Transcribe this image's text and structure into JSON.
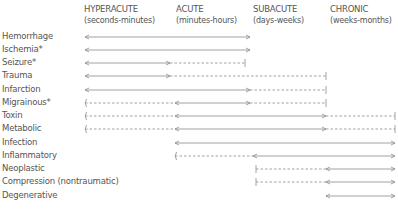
{
  "headers": [
    {
      "title": "HYPERACUTE",
      "sub": "(seconds-minutes)",
      "x": 84
    },
    {
      "title": "ACUTE",
      "sub": "(minutes-hours)",
      "x": 176
    },
    {
      "title": "SUBACUTE",
      "sub": "(days-weeks)",
      "x": 253
    },
    {
      "title": "CHRONIC",
      "sub": "(weeks-months)",
      "x": 330
    }
  ],
  "colors": {
    "text": "#555555",
    "line": "#8a8a8a"
  },
  "timeline_x": {
    "hyper": 85,
    "acute": 175,
    "subacute_start": 252,
    "subacute_end": 327,
    "chronic": 395
  },
  "rows": [
    {
      "label": "Hemorrhage",
      "segments": [
        {
          "from": 85,
          "to": 250,
          "style": "solid",
          "start": "arrow",
          "end": "arrow"
        }
      ]
    },
    {
      "label": "Ischemia*",
      "segments": [
        {
          "from": 85,
          "to": 250,
          "style": "solid",
          "start": "arrow",
          "end": "arrow"
        }
      ]
    },
    {
      "label": "Seizure*",
      "segments": [
        {
          "from": 85,
          "to": 170,
          "style": "solid",
          "start": "arrow",
          "end": "arrow"
        },
        {
          "from": 170,
          "to": 245,
          "style": "dashed",
          "start": "none",
          "end": "bar"
        }
      ]
    },
    {
      "label": "Trauma",
      "segments": [
        {
          "from": 85,
          "to": 170,
          "style": "solid",
          "start": "arrow",
          "end": "arrow"
        },
        {
          "from": 170,
          "to": 326,
          "style": "dashed",
          "start": "none",
          "end": "bar"
        }
      ]
    },
    {
      "label": "Infarction",
      "segments": [
        {
          "from": 85,
          "to": 250,
          "style": "solid",
          "start": "arrow",
          "end": "arrow"
        },
        {
          "from": 250,
          "to": 326,
          "style": "dashed",
          "start": "none",
          "end": "bar"
        }
      ]
    },
    {
      "label": "Migrainous*",
      "segments": [
        {
          "from": 85,
          "to": 175,
          "style": "dashed",
          "start": "paren",
          "end": "none"
        },
        {
          "from": 175,
          "to": 250,
          "style": "solid",
          "start": "arrow",
          "end": "arrow"
        },
        {
          "from": 250,
          "to": 326,
          "style": "dashed",
          "start": "none",
          "end": "bar"
        }
      ]
    },
    {
      "label": "Toxin",
      "segments": [
        {
          "from": 85,
          "to": 175,
          "style": "dashed",
          "start": "paren",
          "end": "none"
        },
        {
          "from": 175,
          "to": 326,
          "style": "solid",
          "start": "arrow",
          "end": "arrow"
        },
        {
          "from": 326,
          "to": 395,
          "style": "dashed",
          "start": "none",
          "end": "bar"
        }
      ]
    },
    {
      "label": "Metabolic",
      "segments": [
        {
          "from": 85,
          "to": 175,
          "style": "dashed",
          "start": "paren",
          "end": "none"
        },
        {
          "from": 175,
          "to": 326,
          "style": "solid",
          "start": "arrow",
          "end": "arrow"
        },
        {
          "from": 326,
          "to": 395,
          "style": "dashed",
          "start": "none",
          "end": "bar"
        }
      ]
    },
    {
      "label": "Infection",
      "segments": [
        {
          "from": 175,
          "to": 395,
          "style": "solid",
          "start": "arrow",
          "end": "arrow"
        }
      ]
    },
    {
      "label": "Inflammatory",
      "segments": [
        {
          "from": 175,
          "to": 253,
          "style": "dashed",
          "start": "paren",
          "end": "none"
        },
        {
          "from": 253,
          "to": 395,
          "style": "solid",
          "start": "arrow",
          "end": "arrow"
        }
      ]
    },
    {
      "label": "Neoplastic",
      "segments": [
        {
          "from": 256,
          "to": 326,
          "style": "dashed",
          "start": "bar",
          "end": "none"
        },
        {
          "from": 326,
          "to": 395,
          "style": "solid",
          "start": "arrow",
          "end": "arrow"
        }
      ]
    },
    {
      "label": "Compression (nontraumatic)",
      "segments": [
        {
          "from": 256,
          "to": 326,
          "style": "dashed",
          "start": "bar",
          "end": "none"
        },
        {
          "from": 326,
          "to": 395,
          "style": "solid",
          "start": "arrow",
          "end": "arrow"
        }
      ]
    },
    {
      "label": "Degenerative",
      "segments": [
        {
          "from": 326,
          "to": 395,
          "style": "solid",
          "start": "arrow",
          "end": "arrow"
        }
      ]
    }
  ]
}
